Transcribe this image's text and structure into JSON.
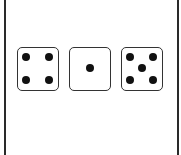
{
  "dice": [
    {
      "value": 4,
      "pips": [
        [
          8,
          9
        ],
        [
          31,
          9
        ],
        [
          8,
          32
        ],
        [
          31,
          32
        ]
      ]
    },
    {
      "value": 1,
      "pips": [
        [
          20,
          20
        ]
      ]
    },
    {
      "value": 5,
      "pips": [
        [
          8,
          9
        ],
        [
          31,
          9
        ],
        [
          20,
          20
        ],
        [
          8,
          32
        ],
        [
          31,
          32
        ]
      ]
    }
  ],
  "positions": [
    17,
    69,
    121
  ],
  "colors": {
    "border": "#2a2a2a",
    "pip": "#111111",
    "background": "#ffffff"
  }
}
